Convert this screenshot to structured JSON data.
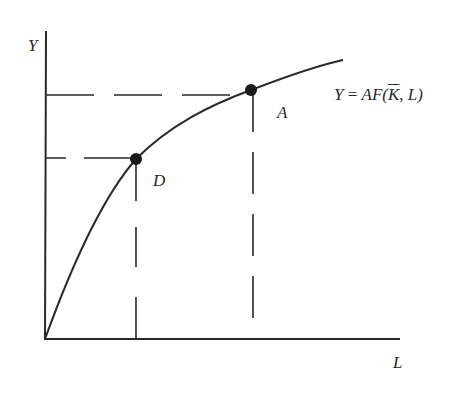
{
  "diagram": {
    "axes": {
      "y_label": "Y",
      "x_label": "L"
    },
    "curve": {
      "label_parts": {
        "lhs": "Y",
        "eq": " = ",
        "func": "AF(",
        "kbar": "K",
        "sep": ", ",
        "arg": "L",
        "close": ")"
      },
      "label_full": "Y = AF(K̄, L)"
    },
    "points": [
      {
        "id": "D",
        "label": "D"
      },
      {
        "id": "A",
        "label": "A"
      }
    ],
    "colors": {
      "line": "#2a2a2a",
      "background": "#ffffff"
    }
  }
}
